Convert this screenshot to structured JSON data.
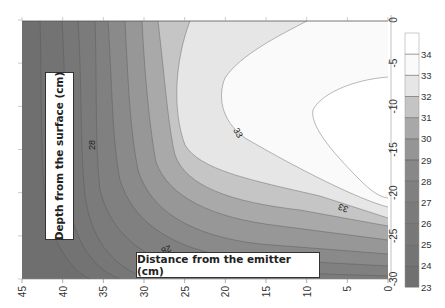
{
  "chart_data": {
    "type": "heatmap",
    "subtype": "filled-contour",
    "orientation": "rotated 90deg (x-axis along bottom reversed, depth axis on right)",
    "title": "",
    "xlabel": "Distance from the emitter (cm)",
    "ylabel": "Depth from the surface (cm)",
    "x_ticks": [
      45,
      40,
      35,
      30,
      25,
      20,
      15,
      10,
      5,
      0
    ],
    "y_ticks": [
      0,
      -5,
      -10,
      -15,
      -20,
      -25,
      -30
    ],
    "xlim": [
      45,
      0
    ],
    "ylim": [
      0,
      -30
    ],
    "colorbar": {
      "ticks": [
        34,
        33,
        32,
        31,
        30,
        29,
        28,
        27,
        26,
        25,
        24,
        23
      ],
      "range": [
        23,
        35
      ],
      "levels": [
        {
          "from": 23,
          "to": 24,
          "color": "#707070"
        },
        {
          "from": 24,
          "to": 25,
          "color": "#747474"
        },
        {
          "from": 25,
          "to": 26,
          "color": "#787878"
        },
        {
          "from": 26,
          "to": 27,
          "color": "#7b7b7b"
        },
        {
          "from": 27,
          "to": 28,
          "color": "#808080"
        },
        {
          "from": 28,
          "to": 29,
          "color": "#888888"
        },
        {
          "from": 29,
          "to": 30,
          "color": "#959595"
        },
        {
          "from": 30,
          "to": 31,
          "color": "#a8a8a8"
        },
        {
          "from": 31,
          "to": 32,
          "color": "#c4c4c4"
        },
        {
          "from": 32,
          "to": 33,
          "color": "#e6e6e6"
        },
        {
          "from": 33,
          "to": 34,
          "color": "#fafafa"
        },
        {
          "from": 34,
          "to": 35,
          "color": "#ffffff"
        }
      ]
    },
    "contour_labels": [
      {
        "value": "28",
        "distance_cm": 36,
        "depth_cm": -15
      },
      {
        "value": "28",
        "distance_cm": 27,
        "depth_cm": -26
      },
      {
        "value": "33",
        "distance_cm": 19,
        "depth_cm": -13
      },
      {
        "value": "33",
        "distance_cm": 5,
        "depth_cm": -21
      }
    ],
    "grid": false,
    "legend": "colorbar right"
  },
  "annotations": {
    "ylabel_text": "Depth from the surface (cm)",
    "xlabel_text": "Distance from the emitter (cm)"
  }
}
